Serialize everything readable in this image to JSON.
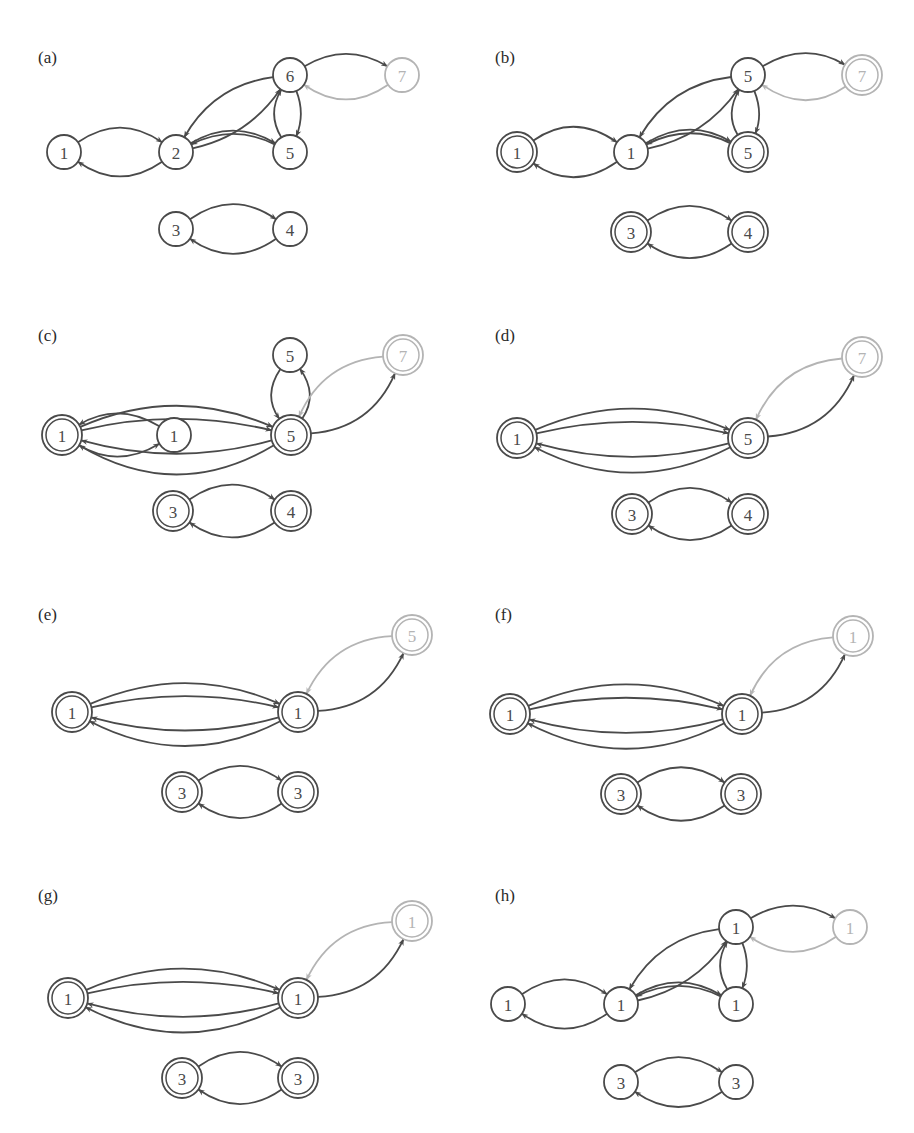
{
  "figure": {
    "colors": {
      "dark": "#4a4a4a",
      "light": "#b4b4b4",
      "background": "#ffffff"
    },
    "node_radius": 17,
    "panels": [
      {
        "id": "a",
        "label": "(a)",
        "label_pos": [
          38,
          57
        ],
        "nodes": [
          {
            "id": "n1",
            "text": "1",
            "x": 64,
            "y": 152,
            "double": false,
            "light": false
          },
          {
            "id": "n2",
            "text": "2",
            "x": 176,
            "y": 152,
            "double": false,
            "light": false
          },
          {
            "id": "n5",
            "text": "5",
            "x": 290,
            "y": 152,
            "double": false,
            "light": false
          },
          {
            "id": "n6",
            "text": "6",
            "x": 290,
            "y": 75,
            "double": false,
            "light": false
          },
          {
            "id": "n7",
            "text": "7",
            "x": 402,
            "y": 75,
            "double": false,
            "light": true
          },
          {
            "id": "n3",
            "text": "3",
            "x": 176,
            "y": 229,
            "double": false,
            "light": false
          },
          {
            "id": "n4",
            "text": "4",
            "x": 290,
            "y": 229,
            "double": false,
            "light": false
          }
        ],
        "edges": [
          {
            "from": "n2",
            "to": "n1",
            "bend": -0.35
          },
          {
            "from": "n1",
            "to": "n2",
            "bend": -0.35
          },
          {
            "from": "n2",
            "to": "n5",
            "bend": -0.3
          },
          {
            "from": "n5",
            "to": "n2",
            "bend": 0.25
          },
          {
            "from": "n2",
            "to": "n6",
            "bend": 0.2
          },
          {
            "from": "n6",
            "to": "n2",
            "bend": 0.25
          },
          {
            "from": "n6",
            "to": "n5",
            "bend": -0.2
          },
          {
            "from": "n5",
            "to": "n6",
            "bend": -0.3
          },
          {
            "from": "n6",
            "to": "n7",
            "bend": -0.3
          },
          {
            "from": "n7",
            "to": "n6",
            "bend": -0.35,
            "light": true
          },
          {
            "from": "n4",
            "to": "n3",
            "bend": -0.35
          },
          {
            "from": "n3",
            "to": "n4",
            "bend": -0.35
          }
        ]
      },
      {
        "id": "b",
        "label": "(b)",
        "label_pos": [
          495,
          57
        ],
        "nodes": [
          {
            "id": "n1",
            "text": "1",
            "x": 517,
            "y": 152,
            "double": true,
            "light": false
          },
          {
            "id": "n2",
            "text": "1",
            "x": 631,
            "y": 152,
            "double": false,
            "light": false
          },
          {
            "id": "n5",
            "text": "5",
            "x": 748,
            "y": 152,
            "double": true,
            "light": false
          },
          {
            "id": "n6",
            "text": "5",
            "x": 748,
            "y": 75,
            "double": false,
            "light": false
          },
          {
            "id": "n7",
            "text": "7",
            "x": 862,
            "y": 75,
            "double": true,
            "light": true
          },
          {
            "id": "n3",
            "text": "3",
            "x": 631,
            "y": 232,
            "double": true,
            "light": false
          },
          {
            "id": "n4",
            "text": "4",
            "x": 748,
            "y": 232,
            "double": true,
            "light": false
          }
        ],
        "edges": [
          {
            "from": "n2",
            "to": "n1",
            "bend": -0.35
          },
          {
            "from": "n1",
            "to": "n2",
            "bend": -0.35
          },
          {
            "from": "n2",
            "to": "n5",
            "bend": -0.3
          },
          {
            "from": "n5",
            "to": "n2",
            "bend": 0.25
          },
          {
            "from": "n2",
            "to": "n6",
            "bend": 0.2
          },
          {
            "from": "n6",
            "to": "n2",
            "bend": 0.25
          },
          {
            "from": "n6",
            "to": "n5",
            "bend": -0.2
          },
          {
            "from": "n5",
            "to": "n6",
            "bend": -0.3
          },
          {
            "from": "n6",
            "to": "n7",
            "bend": -0.3
          },
          {
            "from": "n7",
            "to": "n6",
            "bend": -0.35,
            "light": true
          },
          {
            "from": "n4",
            "to": "n3",
            "bend": -0.35
          },
          {
            "from": "n3",
            "to": "n4",
            "bend": -0.35
          }
        ]
      },
      {
        "id": "c",
        "label": "(c)",
        "label_pos": [
          38,
          335
        ],
        "nodes": [
          {
            "id": "n1",
            "text": "1",
            "x": 62,
            "y": 435,
            "double": true,
            "light": false
          },
          {
            "id": "n2",
            "text": "1",
            "x": 174,
            "y": 435,
            "double": false,
            "light": false
          },
          {
            "id": "n5",
            "text": "5",
            "x": 291,
            "y": 435,
            "double": true,
            "light": false
          },
          {
            "id": "n6",
            "text": "5",
            "x": 290,
            "y": 355,
            "double": false,
            "light": false
          },
          {
            "id": "n7",
            "text": "7",
            "x": 403,
            "y": 355,
            "double": true,
            "light": true
          },
          {
            "id": "n3",
            "text": "3",
            "x": 173,
            "y": 511,
            "double": true,
            "light": false
          },
          {
            "id": "n4",
            "text": "4",
            "x": 291,
            "y": 511,
            "double": true,
            "light": false
          }
        ],
        "edges": [
          {
            "from": "n2",
            "to": "n1",
            "bend": 0.3
          },
          {
            "from": "n1",
            "to": "n2",
            "bend": 0.3
          },
          {
            "from": "n1",
            "to": "n5",
            "bend": -0.22
          },
          {
            "from": "n5",
            "to": "n1",
            "bend": -0.3
          },
          {
            "from": "n1",
            "to": "n5",
            "bend": -0.12
          },
          {
            "from": "n5",
            "to": "n1",
            "bend": -0.14
          },
          {
            "from": "n6",
            "to": "n5",
            "bend": 0.35
          },
          {
            "from": "n5",
            "to": "n6",
            "bend": 0.35
          },
          {
            "from": "n5",
            "to": "n7",
            "bend": 0.3
          },
          {
            "from": "n7",
            "to": "n5",
            "bend": 0.3,
            "light": true
          },
          {
            "from": "n4",
            "to": "n3",
            "bend": -0.35
          },
          {
            "from": "n3",
            "to": "n4",
            "bend": -0.35
          }
        ]
      },
      {
        "id": "d",
        "label": "(d)",
        "label_pos": [
          495,
          335
        ],
        "nodes": [
          {
            "id": "n1",
            "text": "1",
            "x": 517,
            "y": 438,
            "double": true,
            "light": false
          },
          {
            "id": "n5",
            "text": "5",
            "x": 748,
            "y": 438,
            "double": true,
            "light": false
          },
          {
            "id": "n7",
            "text": "7",
            "x": 862,
            "y": 357,
            "double": true,
            "light": true
          },
          {
            "id": "n3",
            "text": "3",
            "x": 632,
            "y": 514,
            "double": true,
            "light": false
          },
          {
            "id": "n4",
            "text": "4",
            "x": 748,
            "y": 514,
            "double": true,
            "light": false
          }
        ],
        "edges": [
          {
            "from": "n1",
            "to": "n5",
            "bend": -0.22
          },
          {
            "from": "n1",
            "to": "n5",
            "bend": -0.12
          },
          {
            "from": "n5",
            "to": "n1",
            "bend": -0.14
          },
          {
            "from": "n5",
            "to": "n1",
            "bend": -0.26
          },
          {
            "from": "n5",
            "to": "n7",
            "bend": 0.3
          },
          {
            "from": "n7",
            "to": "n5",
            "bend": 0.3,
            "light": true
          },
          {
            "from": "n4",
            "to": "n3",
            "bend": -0.35
          },
          {
            "from": "n3",
            "to": "n4",
            "bend": -0.35
          }
        ]
      },
      {
        "id": "e",
        "label": "(e)",
        "label_pos": [
          38,
          614
        ],
        "nodes": [
          {
            "id": "n1",
            "text": "1",
            "x": 72,
            "y": 712,
            "double": true,
            "light": false
          },
          {
            "id": "n5",
            "text": "1",
            "x": 298,
            "y": 712,
            "double": true,
            "light": false
          },
          {
            "id": "n7",
            "text": "5",
            "x": 412,
            "y": 635,
            "double": true,
            "light": true
          },
          {
            "id": "n3",
            "text": "3",
            "x": 182,
            "y": 792,
            "double": true,
            "light": false
          },
          {
            "id": "n4",
            "text": "3",
            "x": 298,
            "y": 792,
            "double": true,
            "light": false
          }
        ],
        "edges": [
          {
            "from": "n1",
            "to": "n5",
            "bend": -0.22
          },
          {
            "from": "n1",
            "to": "n5",
            "bend": -0.12
          },
          {
            "from": "n5",
            "to": "n1",
            "bend": -0.14
          },
          {
            "from": "n5",
            "to": "n1",
            "bend": -0.26
          },
          {
            "from": "n5",
            "to": "n7",
            "bend": 0.3
          },
          {
            "from": "n7",
            "to": "n5",
            "bend": 0.3,
            "light": true
          },
          {
            "from": "n4",
            "to": "n3",
            "bend": -0.35
          },
          {
            "from": "n3",
            "to": "n4",
            "bend": -0.35
          }
        ]
      },
      {
        "id": "f",
        "label": "(f)",
        "label_pos": [
          495,
          614
        ],
        "nodes": [
          {
            "id": "n1",
            "text": "1",
            "x": 510,
            "y": 714,
            "double": true,
            "light": false
          },
          {
            "id": "n5",
            "text": "1",
            "x": 742,
            "y": 714,
            "double": true,
            "light": false
          },
          {
            "id": "n7",
            "text": "1",
            "x": 853,
            "y": 636,
            "double": true,
            "light": true
          },
          {
            "id": "n3",
            "text": "3",
            "x": 621,
            "y": 794,
            "double": true,
            "light": false
          },
          {
            "id": "n4",
            "text": "3",
            "x": 741,
            "y": 794,
            "double": true,
            "light": false
          }
        ],
        "edges": [
          {
            "from": "n1",
            "to": "n5",
            "bend": -0.22
          },
          {
            "from": "n1",
            "to": "n5",
            "bend": -0.12
          },
          {
            "from": "n5",
            "to": "n1",
            "bend": -0.14
          },
          {
            "from": "n5",
            "to": "n1",
            "bend": -0.26
          },
          {
            "from": "n5",
            "to": "n7",
            "bend": 0.3
          },
          {
            "from": "n7",
            "to": "n5",
            "bend": 0.3,
            "light": true
          },
          {
            "from": "n4",
            "to": "n3",
            "bend": -0.35
          },
          {
            "from": "n3",
            "to": "n4",
            "bend": -0.35
          }
        ]
      },
      {
        "id": "g",
        "label": "(g)",
        "label_pos": [
          38,
          895
        ],
        "nodes": [
          {
            "id": "n1",
            "text": "1",
            "x": 68,
            "y": 998,
            "double": true,
            "light": false
          },
          {
            "id": "n5",
            "text": "1",
            "x": 298,
            "y": 998,
            "double": true,
            "light": false
          },
          {
            "id": "n7",
            "text": "1",
            "x": 412,
            "y": 921,
            "double": true,
            "light": true
          },
          {
            "id": "n3",
            "text": "3",
            "x": 182,
            "y": 1078,
            "double": true,
            "light": false
          },
          {
            "id": "n4",
            "text": "3",
            "x": 298,
            "y": 1078,
            "double": true,
            "light": false
          }
        ],
        "edges": [
          {
            "from": "n1",
            "to": "n5",
            "bend": -0.22
          },
          {
            "from": "n1",
            "to": "n5",
            "bend": -0.12
          },
          {
            "from": "n5",
            "to": "n1",
            "bend": -0.14
          },
          {
            "from": "n5",
            "to": "n1",
            "bend": -0.26
          },
          {
            "from": "n5",
            "to": "n7",
            "bend": 0.3
          },
          {
            "from": "n7",
            "to": "n5",
            "bend": 0.3,
            "light": true
          },
          {
            "from": "n4",
            "to": "n3",
            "bend": -0.35
          },
          {
            "from": "n3",
            "to": "n4",
            "bend": -0.35
          }
        ]
      },
      {
        "id": "h",
        "label": "(h)",
        "label_pos": [
          495,
          895
        ],
        "nodes": [
          {
            "id": "n1",
            "text": "1",
            "x": 508,
            "y": 1004,
            "double": false,
            "light": false
          },
          {
            "id": "n2",
            "text": "1",
            "x": 621,
            "y": 1004,
            "double": false,
            "light": false
          },
          {
            "id": "n5",
            "text": "1",
            "x": 736,
            "y": 1004,
            "double": false,
            "light": false
          },
          {
            "id": "n6",
            "text": "1",
            "x": 736,
            "y": 927,
            "double": false,
            "light": false
          },
          {
            "id": "n7",
            "text": "1",
            "x": 850,
            "y": 927,
            "double": false,
            "light": true
          },
          {
            "id": "n3",
            "text": "3",
            "x": 621,
            "y": 1082,
            "double": false,
            "light": false
          },
          {
            "id": "n4",
            "text": "3",
            "x": 736,
            "y": 1082,
            "double": false,
            "light": false
          }
        ],
        "edges": [
          {
            "from": "n2",
            "to": "n1",
            "bend": -0.35
          },
          {
            "from": "n1",
            "to": "n2",
            "bend": -0.35
          },
          {
            "from": "n2",
            "to": "n5",
            "bend": -0.3
          },
          {
            "from": "n5",
            "to": "n2",
            "bend": 0.25
          },
          {
            "from": "n2",
            "to": "n6",
            "bend": 0.2
          },
          {
            "from": "n6",
            "to": "n2",
            "bend": 0.25
          },
          {
            "from": "n6",
            "to": "n5",
            "bend": -0.2
          },
          {
            "from": "n5",
            "to": "n6",
            "bend": -0.3
          },
          {
            "from": "n6",
            "to": "n7",
            "bend": -0.3
          },
          {
            "from": "n7",
            "to": "n6",
            "bend": -0.35,
            "light": true
          },
          {
            "from": "n4",
            "to": "n3",
            "bend": -0.35
          },
          {
            "from": "n3",
            "to": "n4",
            "bend": -0.35
          }
        ]
      }
    ]
  }
}
